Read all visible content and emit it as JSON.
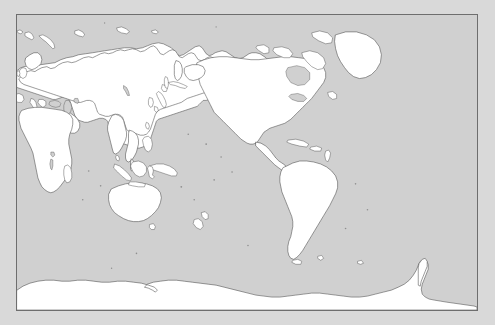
{
  "viewer": {
    "title": "World Map",
    "background_color": "#d9d9d9"
  },
  "map": {
    "name": "World Map",
    "projection": "Equirectangular (Plate Carrée)",
    "center_longitude": "150E",
    "frame_color": "#6e6e6e",
    "ocean_color": "#d0d0d0",
    "land_color": "#ffffff",
    "coastline_color": "#4a4a4a",
    "has_graticule": "no",
    "has_labels": "no",
    "lon_range": "-30E to 330E",
    "lat_range": "90N to 90S",
    "continents": [
      "Eurasia",
      "Africa",
      "North America",
      "South America",
      "Australia",
      "Antarctica"
    ],
    "notable_features": [
      "Greenland",
      "Canadian Arctic Archipelago",
      "Scandinavia",
      "British Isles",
      "Japan",
      "Indonesia",
      "Philippines",
      "New Zealand",
      "Madagascar",
      "Caribbean islands",
      "Svalbard",
      "Novaya Zemlya",
      "Caspian Sea",
      "Black Sea",
      "Mediterranean Sea",
      "Great Lakes",
      "Antarctic Peninsula",
      "Tierra del Fuego"
    ]
  }
}
